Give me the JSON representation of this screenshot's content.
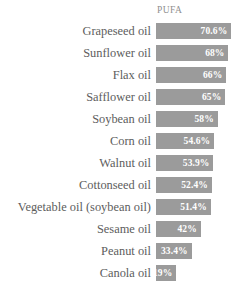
{
  "chart_data": {
    "type": "bar",
    "orientation": "horizontal",
    "title": "",
    "subtitle": "",
    "xlabel": "",
    "ylabel": "",
    "series_header": "PUFA",
    "grid": false,
    "legend": "none",
    "xlim": [
      0,
      76
    ],
    "categories": [
      "Grapeseed oil",
      "Sunflower oil",
      "Flax oil",
      "Safflower oil",
      "Soybean oil",
      "Corn oil",
      "Walnut oil",
      "Cottonseed oil",
      "Vegetable oil (soybean oil)",
      "Sesame oil",
      "Peanut oil",
      "Canola oil"
    ],
    "values": [
      70.6,
      68,
      66,
      65,
      58,
      54.6,
      53.9,
      52.4,
      51.4,
      42,
      33.4,
      19
    ],
    "value_labels": [
      "70.6%",
      "68%",
      "66%",
      "65%",
      "58%",
      "54.6%",
      "53.9%",
      "52.4%",
      "51.4%",
      "42%",
      "33.4%",
      "19%"
    ],
    "rows": [
      {
        "category": "Grapeseed oil",
        "value": 70.6,
        "label": "70.6%"
      },
      {
        "category": "Sunflower oil",
        "value": 68,
        "label": "68%"
      },
      {
        "category": "Flax oil",
        "value": 66,
        "label": "66%"
      },
      {
        "category": "Safflower oil",
        "value": 65,
        "label": "65%"
      },
      {
        "category": "Soybean oil",
        "value": 58,
        "label": "58%"
      },
      {
        "category": "Corn oil",
        "value": 54.6,
        "label": "54.6%"
      },
      {
        "category": "Walnut oil",
        "value": 53.9,
        "label": "53.9%"
      },
      {
        "category": "Cottonseed oil",
        "value": 52.4,
        "label": "52.4%"
      },
      {
        "category": "Vegetable oil (soybean oil)",
        "value": 51.4,
        "label": "51.4%"
      },
      {
        "category": "Sesame oil",
        "value": 42,
        "label": "42%"
      },
      {
        "category": "Peanut oil",
        "value": 33.4,
        "label": "33.4%"
      },
      {
        "category": "Canola oil",
        "value": 19,
        "label": "19%"
      }
    ]
  },
  "colors": {
    "bar": "#9b9b9b",
    "value_text": "#ffffff",
    "category_text": "#5d5d5d",
    "header_text": "#8f8f8f",
    "background": "#ffffff"
  }
}
